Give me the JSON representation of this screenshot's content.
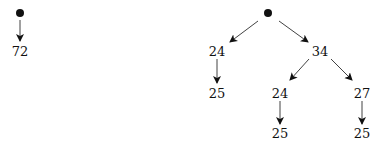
{
  "diagram": {
    "type": "tree",
    "trees": [
      {
        "name": "left-tree",
        "root": {
          "label": "",
          "marker": "filled-dot"
        },
        "nodes": [
          {
            "id": "l1",
            "label": "72"
          }
        ],
        "edges": [
          [
            "root",
            "l1"
          ]
        ]
      },
      {
        "name": "right-tree",
        "root": {
          "label": "",
          "marker": "filled-dot"
        },
        "nodes": [
          {
            "id": "r1",
            "label": "24"
          },
          {
            "id": "r2",
            "label": "34"
          },
          {
            "id": "r3",
            "label": "25"
          },
          {
            "id": "r4",
            "label": "24"
          },
          {
            "id": "r5",
            "label": "27"
          },
          {
            "id": "r6",
            "label": "25"
          },
          {
            "id": "r7",
            "label": "25"
          }
        ],
        "edges": [
          [
            "root",
            "r1"
          ],
          [
            "root",
            "r2"
          ],
          [
            "r1",
            "r3"
          ],
          [
            "r2",
            "r4"
          ],
          [
            "r2",
            "r5"
          ],
          [
            "r4",
            "r6"
          ],
          [
            "r5",
            "r7"
          ]
        ]
      }
    ]
  },
  "labels": {
    "l1": "72",
    "r1": "24",
    "r2": "34",
    "r3": "25",
    "r4": "24",
    "r5": "27",
    "r6": "25",
    "r7": "25"
  }
}
